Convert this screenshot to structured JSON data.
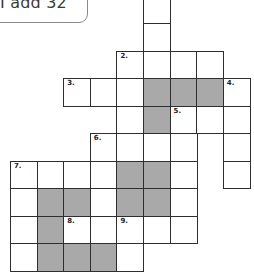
{
  "clue_box": {
    "text": "I add 32"
  },
  "colors": {
    "line": "#2e2e2e",
    "shaded": "#a9a9a9",
    "blank": "#ffffff"
  },
  "crossword": {
    "rows": 10,
    "cols": 9,
    "cells": [
      {
        "r": 0,
        "c": 5,
        "shaded": false,
        "num": ""
      },
      {
        "r": 1,
        "c": 5,
        "shaded": false,
        "num": ""
      },
      {
        "r": 2,
        "c": 4,
        "shaded": false,
        "num": "2."
      },
      {
        "r": 2,
        "c": 5,
        "shaded": false,
        "num": ""
      },
      {
        "r": 2,
        "c": 6,
        "shaded": false,
        "num": ""
      },
      {
        "r": 2,
        "c": 7,
        "shaded": false,
        "num": ""
      },
      {
        "r": 3,
        "c": 2,
        "shaded": false,
        "num": "3."
      },
      {
        "r": 3,
        "c": 3,
        "shaded": false,
        "num": ""
      },
      {
        "r": 3,
        "c": 4,
        "shaded": false,
        "num": ""
      },
      {
        "r": 3,
        "c": 5,
        "shaded": true,
        "num": ""
      },
      {
        "r": 3,
        "c": 6,
        "shaded": true,
        "num": ""
      },
      {
        "r": 3,
        "c": 7,
        "shaded": true,
        "num": ""
      },
      {
        "r": 3,
        "c": 8,
        "shaded": false,
        "num": "4."
      },
      {
        "r": 4,
        "c": 4,
        "shaded": false,
        "num": ""
      },
      {
        "r": 4,
        "c": 5,
        "shaded": true,
        "num": ""
      },
      {
        "r": 4,
        "c": 6,
        "shaded": false,
        "num": "5."
      },
      {
        "r": 4,
        "c": 7,
        "shaded": false,
        "num": ""
      },
      {
        "r": 4,
        "c": 8,
        "shaded": false,
        "num": ""
      },
      {
        "r": 5,
        "c": 3,
        "shaded": false,
        "num": "6."
      },
      {
        "r": 5,
        "c": 4,
        "shaded": false,
        "num": ""
      },
      {
        "r": 5,
        "c": 5,
        "shaded": false,
        "num": ""
      },
      {
        "r": 5,
        "c": 6,
        "shaded": false,
        "num": ""
      },
      {
        "r": 5,
        "c": 8,
        "shaded": false,
        "num": ""
      },
      {
        "r": 6,
        "c": 0,
        "shaded": false,
        "num": "7."
      },
      {
        "r": 6,
        "c": 1,
        "shaded": false,
        "num": ""
      },
      {
        "r": 6,
        "c": 2,
        "shaded": false,
        "num": ""
      },
      {
        "r": 6,
        "c": 3,
        "shaded": false,
        "num": ""
      },
      {
        "r": 6,
        "c": 4,
        "shaded": true,
        "num": ""
      },
      {
        "r": 6,
        "c": 5,
        "shaded": true,
        "num": ""
      },
      {
        "r": 6,
        "c": 6,
        "shaded": false,
        "num": ""
      },
      {
        "r": 6,
        "c": 8,
        "shaded": false,
        "num": ""
      },
      {
        "r": 7,
        "c": 0,
        "shaded": false,
        "num": ""
      },
      {
        "r": 7,
        "c": 1,
        "shaded": true,
        "num": ""
      },
      {
        "r": 7,
        "c": 2,
        "shaded": true,
        "num": ""
      },
      {
        "r": 7,
        "c": 3,
        "shaded": false,
        "num": ""
      },
      {
        "r": 7,
        "c": 4,
        "shaded": true,
        "num": ""
      },
      {
        "r": 7,
        "c": 5,
        "shaded": true,
        "num": ""
      },
      {
        "r": 7,
        "c": 6,
        "shaded": false,
        "num": ""
      },
      {
        "r": 8,
        "c": 0,
        "shaded": false,
        "num": ""
      },
      {
        "r": 8,
        "c": 1,
        "shaded": true,
        "num": ""
      },
      {
        "r": 8,
        "c": 2,
        "shaded": false,
        "num": "8."
      },
      {
        "r": 8,
        "c": 3,
        "shaded": false,
        "num": ""
      },
      {
        "r": 8,
        "c": 4,
        "shaded": false,
        "num": "9."
      },
      {
        "r": 8,
        "c": 5,
        "shaded": false,
        "num": ""
      },
      {
        "r": 8,
        "c": 6,
        "shaded": false,
        "num": ""
      },
      {
        "r": 9,
        "c": 0,
        "shaded": false,
        "num": ""
      },
      {
        "r": 9,
        "c": 1,
        "shaded": true,
        "num": ""
      },
      {
        "r": 9,
        "c": 2,
        "shaded": true,
        "num": ""
      },
      {
        "r": 9,
        "c": 3,
        "shaded": true,
        "num": ""
      },
      {
        "r": 9,
        "c": 4,
        "shaded": false,
        "num": ""
      }
    ]
  }
}
